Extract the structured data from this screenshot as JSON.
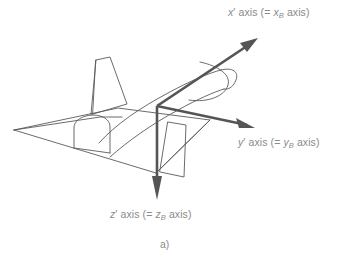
{
  "figure": {
    "caption": "a)",
    "background_color": "#ffffff",
    "line_color": "#555555",
    "text_color": "#8a8a8a",
    "width": 345,
    "height": 266
  },
  "labels": {
    "x_axis": {
      "prefix": "x",
      "prime": "′",
      "mid": " axis (= ",
      "sub_symbol": "x",
      "sub": "B",
      "suffix": " axis)",
      "full_text": "x′ axis (= xB axis)"
    },
    "y_axis": {
      "prefix": "y",
      "prime": "′",
      "mid": " axis (= ",
      "sub_symbol": "y",
      "sub": "B",
      "suffix": " axis)",
      "full_text": "y′ axis (= yB axis)"
    },
    "z_axis": {
      "prefix": "z",
      "prime": "′",
      "mid": " axis (= ",
      "sub_symbol": "z",
      "sub": "B",
      "suffix": " axis)",
      "full_text": "z′ axis (= zB axis)"
    }
  },
  "axes": {
    "origin": {
      "x": 157,
      "y": 106
    },
    "x_tip": {
      "x": 258,
      "y": 38
    },
    "y_tip": {
      "x": 255,
      "y": 128
    },
    "z_tip": {
      "x": 157,
      "y": 200
    }
  },
  "aircraft": {
    "parts": [
      "fuselage",
      "delta-wing",
      "vertical-tail-fin",
      "engine-nacelle",
      "ventral-fin"
    ]
  }
}
